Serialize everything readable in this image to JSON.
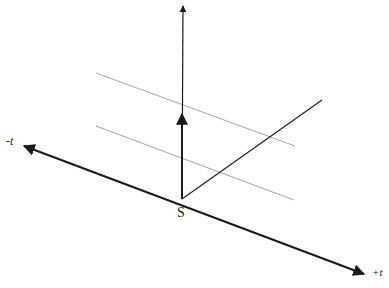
{
  "diagram": {
    "type": "spacetime-axes",
    "origin_label": "S",
    "axis_labels": {
      "negative_t": "-t",
      "positive_t": "+t"
    },
    "colors": {
      "axis": "#1a1a1a",
      "guide_lines": "#9a9a9a",
      "label": "#222222",
      "background": "#ffffff"
    },
    "elements": {
      "vertical_axis": {
        "from": [
          182,
          199
        ],
        "to": [
          183,
          5
        ],
        "arrow": true
      },
      "short_vector": {
        "from": [
          182,
          199
        ],
        "to": [
          182,
          113
        ],
        "arrow": true
      },
      "diagonal_axis": {
        "from": [
          182,
          199
        ],
        "to": [
          322,
          100
        ],
        "arrow": false
      },
      "time_axis": {
        "from": [
          22,
          145
        ],
        "to": [
          366,
          275
        ],
        "arrow_both_ends": true
      },
      "guide_lines": [
        {
          "from": [
            96,
            73
          ],
          "to": [
            295,
            146
          ]
        },
        {
          "from": [
            96,
            126
          ],
          "to": [
            294,
            200
          ]
        }
      ]
    }
  }
}
